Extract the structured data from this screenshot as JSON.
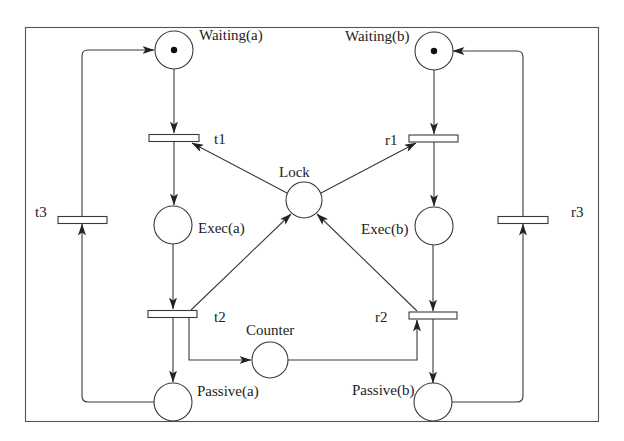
{
  "diagram": {
    "type": "petri-net",
    "places": [
      {
        "id": "waiting_a",
        "label": "Waiting(a)",
        "tokens": 1
      },
      {
        "id": "exec_a",
        "label": "Exec(a)",
        "tokens": 0
      },
      {
        "id": "passive_a",
        "label": "Passive(a)",
        "tokens": 0
      },
      {
        "id": "lock",
        "label": "Lock",
        "tokens": 0
      },
      {
        "id": "counter",
        "label": "Counter",
        "tokens": 0
      },
      {
        "id": "waiting_b",
        "label": "Waiting(b)",
        "tokens": 1
      },
      {
        "id": "exec_b",
        "label": "Exec(b)",
        "tokens": 0
      },
      {
        "id": "passive_b",
        "label": "Passive(b)",
        "tokens": 0
      }
    ],
    "transitions": [
      {
        "id": "t1",
        "label": "t1"
      },
      {
        "id": "t2",
        "label": "t2"
      },
      {
        "id": "t3",
        "label": "t3"
      },
      {
        "id": "r1",
        "label": "r1"
      },
      {
        "id": "r2",
        "label": "r2"
      },
      {
        "id": "r3",
        "label": "r3"
      }
    ],
    "arcs": [
      [
        "Waiting(a)",
        "t1"
      ],
      [
        "Lock",
        "t1"
      ],
      [
        "t1",
        "Exec(a)"
      ],
      [
        "Exec(a)",
        "t2"
      ],
      [
        "t2",
        "Lock"
      ],
      [
        "t2",
        "Passive(a)"
      ],
      [
        "t2",
        "Counter"
      ],
      [
        "Passive(a)",
        "t3"
      ],
      [
        "t3",
        "Waiting(a)"
      ],
      [
        "Waiting(b)",
        "r1"
      ],
      [
        "Lock",
        "r1"
      ],
      [
        "r1",
        "Exec(b)"
      ],
      [
        "Exec(b)",
        "r2"
      ],
      [
        "Counter",
        "r2"
      ],
      [
        "r2",
        "Lock"
      ],
      [
        "r2",
        "Passive(b)"
      ],
      [
        "Passive(b)",
        "r3"
      ],
      [
        "r3",
        "Waiting(b)"
      ]
    ]
  },
  "labels": {
    "waiting_a": "Waiting(a)",
    "waiting_b": "Waiting(b)",
    "exec_a": "Exec(a)",
    "exec_b": "Exec(b)",
    "passive_a": "Passive(a)",
    "passive_b": "Passive(b)",
    "lock": "Lock",
    "counter": "Counter",
    "t1": "t1",
    "t2": "t2",
    "t3": "t3",
    "r1": "r1",
    "r2": "r2",
    "r3": "r3"
  }
}
